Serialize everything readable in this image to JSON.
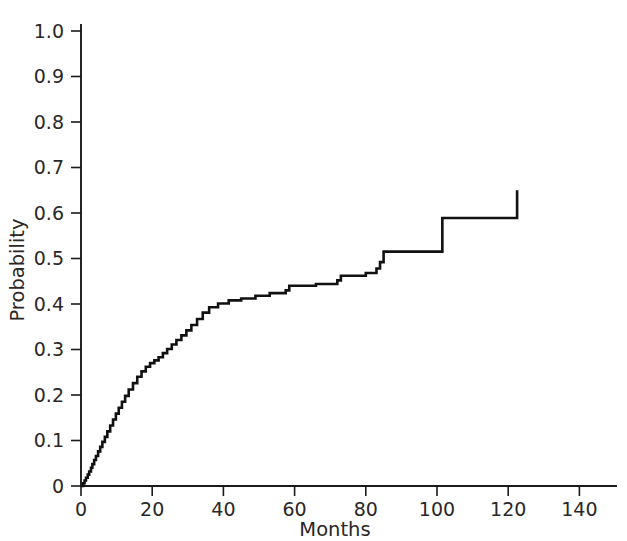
{
  "chart_data": {
    "type": "line",
    "subtype": "step-cumulative-incidence",
    "title": "",
    "subtitle": "",
    "xlabel": "Months",
    "ylabel": "Probability",
    "xlim": [
      0,
      145
    ],
    "ylim": [
      0,
      1.04
    ],
    "grid": false,
    "legend": null,
    "x_ticks": [
      0,
      20,
      40,
      60,
      80,
      100,
      120,
      140
    ],
    "x_tick_labels": [
      "0",
      "20",
      "40",
      "60",
      "80",
      "100",
      "120",
      "140"
    ],
    "y_ticks": [
      0,
      0.1,
      0.2,
      0.3,
      0.4,
      0.5,
      0.6,
      0.7,
      0.8,
      0.9,
      1.0
    ],
    "y_tick_labels": [
      "0",
      "0.1",
      "0.2",
      "0.3",
      "0.4",
      "0.5",
      "0.6",
      "0.7",
      "0.8",
      "0.9",
      "1.0"
    ],
    "line_color": "#111111",
    "axis_color": "#1a1a1a",
    "series": [
      {
        "name": "Cumulative probability",
        "step": "post",
        "x": [
          0,
          0.6,
          1.0,
          1.4,
          1.9,
          2.3,
          2.8,
          3.2,
          3.7,
          4.2,
          4.8,
          5.4,
          6.0,
          6.7,
          7.4,
          8.2,
          9.0,
          9.8,
          10.6,
          11.5,
          12.4,
          13.4,
          14.6,
          15.8,
          17.0,
          18.2,
          19.4,
          20.6,
          21.8,
          23.0,
          24.2,
          25.5,
          26.8,
          28.2,
          29.6,
          31.0,
          32.6,
          34.2,
          36.0,
          38.5,
          41.5,
          45.0,
          49.0,
          53.0,
          57.5,
          58.5,
          66.0,
          72.0,
          73.0,
          80.0,
          83.0,
          84.0,
          85.0,
          101.5,
          122.5
        ],
        "y": [
          0,
          0.006,
          0.012,
          0.018,
          0.025,
          0.032,
          0.04,
          0.048,
          0.057,
          0.066,
          0.076,
          0.086,
          0.097,
          0.108,
          0.12,
          0.133,
          0.146,
          0.159,
          0.172,
          0.185,
          0.198,
          0.212,
          0.226,
          0.24,
          0.252,
          0.262,
          0.27,
          0.276,
          0.283,
          0.292,
          0.301,
          0.311,
          0.321,
          0.331,
          0.342,
          0.354,
          0.367,
          0.381,
          0.393,
          0.401,
          0.408,
          0.412,
          0.418,
          0.424,
          0.43,
          0.44,
          0.444,
          0.452,
          0.462,
          0.468,
          0.478,
          0.492,
          0.515,
          0.589,
          0.65
        ],
        "final_value": 0.65,
        "max_x": 122.5
      }
    ]
  },
  "axis_titles": {
    "y": "Probability",
    "x": "Months"
  }
}
